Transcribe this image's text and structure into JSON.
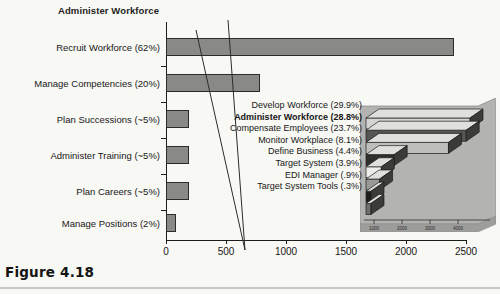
{
  "figure": {
    "caption": "Figure 4.18",
    "title": "Administer Workforce"
  },
  "chart_data": {
    "type": "bar",
    "orientation": "horizontal",
    "title": "Administer Workforce",
    "xlabel": "",
    "ylabel": "",
    "xlim": [
      0,
      2500
    ],
    "xticks": [
      0,
      500,
      1000,
      1500,
      2000,
      2500
    ],
    "grid": false,
    "legend": "none",
    "categories": [
      "Recruit Workforce (62%)",
      "Manage Competencies (20%)",
      "Plan Successions (~5%)",
      "Administer Training (~5%)",
      "Plan Careers (~5%)",
      "Manage Positions (2%)"
    ],
    "values": [
      2400,
      780,
      195,
      195,
      195,
      85
    ],
    "percent_labels": [
      "62%",
      "20%",
      "~5%",
      "~5%",
      "~5%",
      "2%"
    ],
    "bar_color": "#8a8a8a",
    "bar_edge_color": "#2b2b2b"
  },
  "inset_chart": {
    "type": "bar",
    "orientation": "horizontal",
    "style": "3d-stepped",
    "xticks": [
      "1000",
      "2000",
      "3000",
      "4000"
    ],
    "panel_color": "#b5b5b5",
    "categories": [
      "Develop Workforce (29.9%)",
      "Administer Workforce (28.8%)",
      "Compensate Employees (23.7%)",
      "Monitor Workplace (8.1%)",
      "Define Business (4.4%)",
      "Target System (3.9%)",
      "EDI Manager (.9%)",
      "Target System Tools (.3%)"
    ],
    "values": [
      29.9,
      28.8,
      23.7,
      8.1,
      4.4,
      3.9,
      0.9,
      0.3
    ],
    "highlight_index": 1,
    "bar_fills": [
      "#d8d8d8",
      "#555555",
      "#c0c0c0",
      "#2e2e2e",
      "#f0f0f0",
      "#9a9a9a",
      "#1c1c1c",
      "#6e6e6e"
    ]
  },
  "axis": {
    "x_tick_labels": [
      "0",
      "500",
      "1000",
      "1500",
      "2000",
      "2500"
    ]
  }
}
